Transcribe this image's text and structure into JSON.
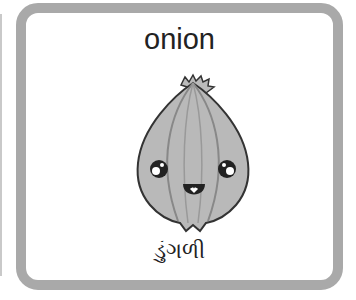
{
  "card": {
    "english_word": "onion",
    "gujarati_word": "ડુંગળી",
    "image": "onion-illustration"
  },
  "colors": {
    "frame": "#a9a9a9",
    "onion_fill": "#b9b9b9",
    "outline": "#333333"
  }
}
